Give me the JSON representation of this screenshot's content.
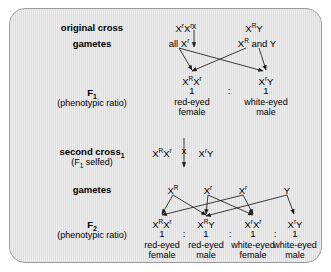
{
  "diagram": {
    "panel_bg": "#dcdcdc",
    "panel_border": "#9a9a9a",
    "text_color": "#000000"
  },
  "stages": {
    "original_cross": "original cross",
    "gametes_1": "gametes",
    "f1_label": "F",
    "f1_sub": "1",
    "f1_note": "(phenotypic ratio)",
    "second_cross": "second cross",
    "second_cross_sub": "1",
    "second_cross_note_pre": "(F",
    "second_cross_note_sub": "1",
    "second_cross_note_post": " selfed)",
    "gametes_2": "gametes",
    "f2_label": "F",
    "f2_sub": "2",
    "f2_note": "(phenotypic ratio)"
  },
  "original_cross": {
    "parent_female": {
      "base": "X",
      "sup1": "r",
      "base2": "X",
      "sup2": "r"
    },
    "cross_symbol": "x",
    "parent_male": {
      "base": "X",
      "sup1": "R",
      "base2": "Y"
    },
    "female_text": "X",
    "male_text": "X"
  },
  "gametes_row1": {
    "left": "all X",
    "left_sup": "r",
    "right_pre": "X",
    "right_sup": "R",
    "right_post": " and Y"
  },
  "f1": {
    "offspring": [
      {
        "genotype_pre": "X",
        "sup1": "R",
        "mid": "X",
        "sup2": "r",
        "tail": "",
        "ratio": "1",
        "pheno_line1": "red-eyed",
        "pheno_line2": "female"
      },
      {
        "genotype_pre": "X",
        "sup1": "r",
        "mid": "Y",
        "sup2": "",
        "tail": "",
        "ratio": "1",
        "pheno_line1": "white-eyed",
        "pheno_line2": "male"
      }
    ],
    "separator": ":"
  },
  "second_cross": {
    "parent_female": {
      "pre": "X",
      "sup1": "R",
      "mid": "X",
      "sup2": "r"
    },
    "cross_symbol": "x",
    "parent_male": {
      "pre": "X",
      "sup1": "r",
      "mid": "Y"
    }
  },
  "gametes_row2": [
    {
      "base": "X",
      "sup": "R"
    },
    {
      "base": "X",
      "sup": "r"
    },
    {
      "base": "X",
      "sup": "r"
    },
    {
      "base": "Y",
      "sup": ""
    }
  ],
  "f2": {
    "offspring": [
      {
        "pre": "X",
        "sup1": "R",
        "mid": "X",
        "sup2": "r",
        "ratio": "1",
        "pheno_line1": "red-eyed",
        "pheno_line2": "female"
      },
      {
        "pre": "X",
        "sup1": "R",
        "mid": "Y",
        "sup2": "",
        "ratio": "1",
        "pheno_line1": "red-eyed",
        "pheno_line2": "male"
      },
      {
        "pre": "X",
        "sup1": "r",
        "mid": "X",
        "sup2": "r",
        "ratio": "1",
        "pheno_line1": "white-eyed",
        "pheno_line2": "female"
      },
      {
        "pre": "X",
        "sup1": "r",
        "mid": "Y",
        "sup2": "",
        "ratio": "1",
        "pheno_line1": "white-eyed",
        "pheno_line2": "male"
      }
    ],
    "separator": ":"
  }
}
